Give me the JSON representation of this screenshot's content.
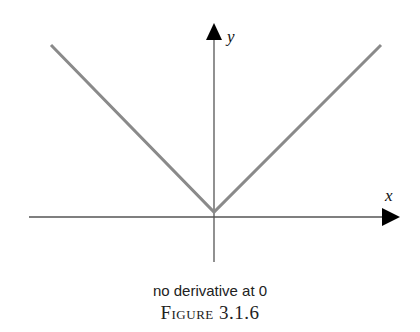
{
  "figure": {
    "caption": "no derivative at 0",
    "label": "Figure 3.1.6"
  },
  "axes": {
    "x_label": "x",
    "y_label": "y"
  },
  "curve": {
    "description": "y = |x|",
    "color": "#8a8a8a"
  },
  "colors": {
    "axis": "#555555",
    "arrow": "#000000",
    "curve": "#8a8a8a"
  }
}
